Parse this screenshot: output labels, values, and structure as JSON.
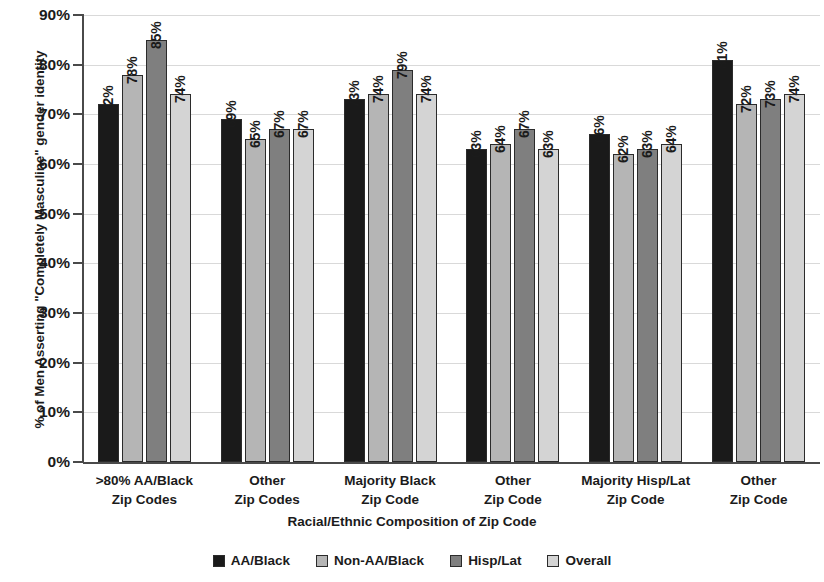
{
  "chart_data": {
    "type": "bar",
    "title": "",
    "xlabel": "Racial/Ethnic Composition of Zip Code",
    "ylabel": "% of Men Asserting \"Completely Masculine\" gender identity",
    "ylim": [
      0,
      90
    ],
    "ytick_labels": [
      "90%",
      "80%",
      "70%",
      "60%",
      "50%",
      "40%",
      "30%",
      "20%",
      "10%",
      "0%"
    ],
    "ytick_values": [
      90,
      80,
      70,
      60,
      50,
      40,
      30,
      20,
      10,
      0
    ],
    "grid": true,
    "legend_position": "bottom",
    "categories": [
      [
        ">80% AA/Black",
        "Zip Codes"
      ],
      [
        "Other",
        "Zip Codes"
      ],
      [
        "Majority Black",
        "Zip Code"
      ],
      [
        "Other",
        "Zip Code"
      ],
      [
        "Majority Hisp/Lat",
        "Zip Code"
      ],
      [
        "Other",
        "Zip Code"
      ]
    ],
    "series": [
      {
        "name": "AA/Black",
        "color": "#1a1a1a",
        "values": [
          72,
          69,
          73,
          63,
          66,
          81
        ],
        "labels": [
          "72%",
          "69%",
          "73%",
          "63%",
          "66%",
          "81%"
        ]
      },
      {
        "name": "Non-AA/Black",
        "color": "#b5b5b5",
        "values": [
          78,
          65,
          74,
          64,
          62,
          72
        ],
        "labels": [
          "78%",
          "65%",
          "74%",
          "64%",
          "62%",
          "72%"
        ]
      },
      {
        "name": "Hisp/Lat",
        "color": "#7f7f7f",
        "values": [
          85,
          67,
          79,
          67,
          63,
          73
        ],
        "labels": [
          "85%",
          "67%",
          "79%",
          "67%",
          "63%",
          "73%"
        ]
      },
      {
        "name": "Overall",
        "color": "#d4d4d4",
        "values": [
          74,
          67,
          74,
          63,
          64,
          74
        ],
        "labels": [
          "74%",
          "67%",
          "74%",
          "63%",
          "64%",
          "74%"
        ]
      }
    ]
  }
}
